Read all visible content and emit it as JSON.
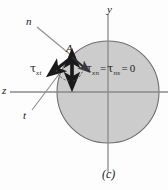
{
  "figure": {
    "caption": "(c)",
    "axes": {
      "y_label": "y",
      "z_label": "z"
    },
    "oblique_axes": {
      "n_label": "n",
      "t_label": "t"
    },
    "point_label": "A",
    "stress_labels": {
      "tau_xt": {
        "symbol": "τ",
        "subscript": "xt"
      },
      "equation": {
        "term1_symbol": "τ",
        "term1_subscript": "xn",
        "eq1": "=",
        "term2_symbol": "τ",
        "term2_subscript": "nx",
        "eq2": "=",
        "value": "0"
      }
    },
    "colors": {
      "circle_fill": "#cccccc",
      "circle_stroke": "#6e6e6e",
      "axis_line": "#8a8a8a",
      "arrow_dark": "#1a1a1a",
      "background": "#fdfdfd"
    },
    "geometry": {
      "circle_center_x": 108,
      "circle_center_y": 92,
      "circle_radius": 51
    }
  }
}
